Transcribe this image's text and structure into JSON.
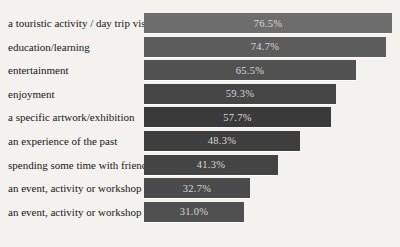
{
  "chart_data": {
    "type": "bar",
    "orientation": "horizontal",
    "title": "",
    "xlabel": "",
    "ylabel": "",
    "xlim": [
      0,
      80
    ],
    "grid": false,
    "legend": "none",
    "categories": [
      "a touristic activity / day trip visit",
      "education/learning",
      "entertainment",
      "enjoyment",
      "a specific artwork/exhibition",
      "an experience of the past",
      "spending some time with friend/s",
      "an event, activity or workshop",
      "an event, activity or workshop"
    ],
    "values": [
      76.5,
      74.7,
      65.5,
      59.3,
      57.7,
      48.3,
      41.3,
      32.7,
      31.0
    ],
    "value_labels": [
      "76.5%",
      "74.7%",
      "65.5%",
      "59.3%",
      "57.7%",
      "48.3%",
      "41.3%",
      "32.7%",
      "31.0%"
    ],
    "bar_colors": [
      "#6d6d6d",
      "#5c5c5c",
      "#515151",
      "#464646",
      "#3a3a3a",
      "#3e3e3e",
      "#444444",
      "#4b4b4b",
      "#505050"
    ]
  },
  "style": {
    "background": "#f4f2ef",
    "category_text_color": "#161616",
    "value_text_color": "#d8d6d3",
    "separator_color": "#ffffff"
  }
}
